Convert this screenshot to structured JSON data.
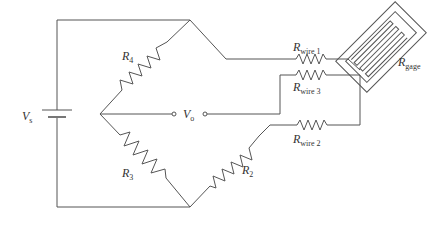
{
  "diagram": {
    "type": "circuit",
    "labels": {
      "vs": {
        "main": "V",
        "sub": "s"
      },
      "vo": {
        "main": "V",
        "sub": "o"
      },
      "r4": {
        "main": "R",
        "sub": "4"
      },
      "r3": {
        "main": "R",
        "sub": "3"
      },
      "r2": {
        "main": "R",
        "sub": "2"
      },
      "rwire1": {
        "main": "R",
        "sub": "wire 1"
      },
      "rwire2": {
        "main": "R",
        "sub": "wire 2"
      },
      "rwire3": {
        "main": "R",
        "sub": "wire 3"
      },
      "rgage": {
        "main": "R",
        "sub": "gage"
      }
    },
    "components": [
      {
        "id": "Vs",
        "kind": "battery"
      },
      {
        "id": "R4",
        "kind": "resistor",
        "between": [
          "left-node",
          "top-node"
        ]
      },
      {
        "id": "R3",
        "kind": "resistor",
        "between": [
          "left-node",
          "bottom-node"
        ]
      },
      {
        "id": "R2",
        "kind": "resistor",
        "between": [
          "bottom-node",
          "Rwire2"
        ]
      },
      {
        "id": "Rwire1",
        "kind": "resistor",
        "between": [
          "top-node",
          "Rgage"
        ]
      },
      {
        "id": "Rwire3",
        "kind": "resistor",
        "between": [
          "Vo-right",
          "Rgage"
        ]
      },
      {
        "id": "Rwire2",
        "kind": "resistor",
        "between": [
          "R2",
          "Rgage"
        ]
      },
      {
        "id": "Rgage",
        "kind": "strain-gage"
      },
      {
        "id": "Vo",
        "kind": "output-terminals"
      }
    ],
    "stroke_color": "#555555"
  }
}
